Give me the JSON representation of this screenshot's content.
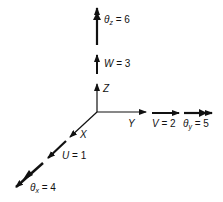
{
  "diagram": {
    "axes": {
      "x": {
        "label": "X"
      },
      "y": {
        "label": "Y"
      },
      "z": {
        "label": "Z"
      }
    },
    "translations": [
      {
        "axis": "x",
        "symbol": "U",
        "eq": "= 1"
      },
      {
        "axis": "y",
        "symbol": "V",
        "eq": "= 2"
      },
      {
        "axis": "z",
        "symbol": "W",
        "eq": "= 3"
      }
    ],
    "rotations": [
      {
        "axis": "x",
        "symbol": "θ",
        "sub": "x",
        "eq": "= 4"
      },
      {
        "axis": "y",
        "symbol": "θ",
        "sub": "y",
        "eq": "= 5"
      },
      {
        "axis": "z",
        "symbol": "θ",
        "sub": "z",
        "eq": "= 6"
      }
    ],
    "colors": {
      "ink": "#111111",
      "background": "#ffffff"
    }
  }
}
